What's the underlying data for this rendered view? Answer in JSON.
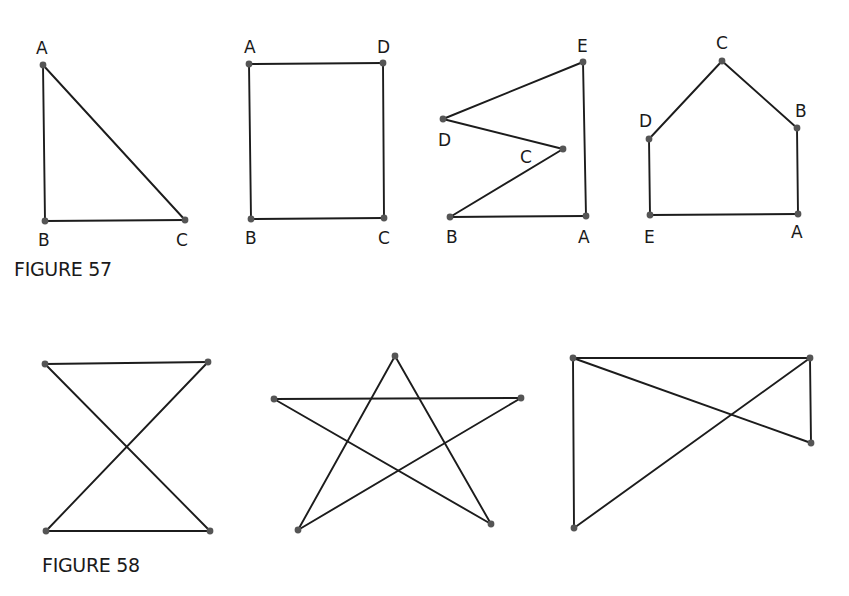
{
  "figures": [
    {
      "caption": "FIGURE 57",
      "caption_pos": [
        14,
        276
      ],
      "shapes": [
        {
          "name": "triangle",
          "points": {
            "A": [
              43,
              65
            ],
            "B": [
              45,
              221
            ],
            "C": [
              185,
              220
            ]
          },
          "edges": [
            [
              "A",
              "B"
            ],
            [
              "B",
              "C"
            ],
            [
              "C",
              "A"
            ]
          ],
          "labels": {
            "A": [
              36,
              54
            ],
            "B": [
              38,
              246
            ],
            "C": [
              176,
              246
            ]
          }
        },
        {
          "name": "rectangle",
          "points": {
            "A": [
              249,
              64
            ],
            "D": [
              383,
              63
            ],
            "B": [
              251,
              219
            ],
            "C": [
              384,
              218
            ]
          },
          "edges": [
            [
              "A",
              "D"
            ],
            [
              "D",
              "C"
            ],
            [
              "C",
              "B"
            ],
            [
              "B",
              "A"
            ]
          ],
          "labels": {
            "A": [
              244,
              53
            ],
            "D": [
              377,
              53
            ],
            "B": [
              245,
              244
            ],
            "C": [
              378,
              244
            ]
          }
        },
        {
          "name": "zigzag-pentagon",
          "points": {
            "E": [
              583,
              62
            ],
            "D": [
              443,
              119
            ],
            "C": [
              563,
              149
            ],
            "B": [
              450,
              217
            ],
            "A": [
              586,
              216
            ]
          },
          "edges": [
            [
              "E",
              "D"
            ],
            [
              "D",
              "C"
            ],
            [
              "C",
              "B"
            ],
            [
              "B",
              "A"
            ],
            [
              "A",
              "E"
            ]
          ],
          "labels": {
            "E": [
              577,
              52
            ],
            "D": [
              438,
              146
            ],
            "C": [
              520,
              163
            ],
            "B": [
              446,
              243
            ],
            "A": [
              578,
              243
            ]
          }
        },
        {
          "name": "house-pentagon",
          "points": {
            "C": [
              722,
              61
            ],
            "B": [
              797,
              128
            ],
            "D": [
              649,
              139
            ],
            "E": [
              650,
              215
            ],
            "A": [
              798,
              214
            ]
          },
          "edges": [
            [
              "D",
              "C"
            ],
            [
              "C",
              "B"
            ],
            [
              "B",
              "A"
            ],
            [
              "A",
              "E"
            ],
            [
              "E",
              "D"
            ]
          ],
          "labels": {
            "C": [
              716,
              49
            ],
            "B": [
              795,
              117
            ],
            "D": [
              639,
              127
            ],
            "E": [
              644,
              243
            ],
            "A": [
              791,
              238
            ]
          }
        }
      ]
    },
    {
      "caption": "FIGURE 58",
      "caption_pos": [
        42,
        572
      ],
      "shapes": [
        {
          "name": "hourglass",
          "points": {
            "p1": [
              45,
              364
            ],
            "p2": [
              208,
              362
            ],
            "p3": [
              46,
              531
            ],
            "p4": [
              210,
              531
            ]
          },
          "edges": [
            [
              "p1",
              "p2"
            ],
            [
              "p2",
              "p3"
            ],
            [
              "p3",
              "p4"
            ],
            [
              "p4",
              "p1"
            ]
          ],
          "labels": {}
        },
        {
          "name": "star",
          "points": {
            "top": [
              395,
              356
            ],
            "left": [
              274,
              399
            ],
            "right": [
              521,
              398
            ],
            "bl": [
              298,
              530
            ],
            "br": [
              491,
              524
            ]
          },
          "edges": [
            [
              "top",
              "bl"
            ],
            [
              "bl",
              "right"
            ],
            [
              "right",
              "left"
            ],
            [
              "left",
              "br"
            ],
            [
              "br",
              "top"
            ]
          ],
          "labels": {}
        },
        {
          "name": "bowtie-quad",
          "points": {
            "tl": [
              573,
              358
            ],
            "tr": [
              810,
              358
            ],
            "r": [
              811,
              443
            ],
            "bl": [
              574,
              528
            ]
          },
          "edges": [
            [
              "tl",
              "tr"
            ],
            [
              "tr",
              "bl"
            ],
            [
              "bl",
              "tl"
            ],
            [
              "tl",
              "r"
            ],
            [
              "r",
              "tr"
            ]
          ],
          "labels": {}
        }
      ]
    }
  ],
  "colors": {
    "ink": "#1c1c1c",
    "vertex": "#555555",
    "background": "#ffffff"
  }
}
